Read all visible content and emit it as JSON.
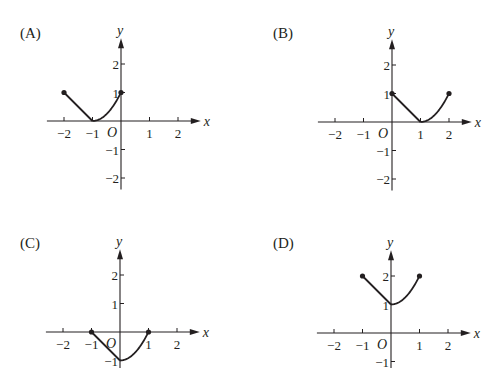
{
  "panels": [
    {
      "label": "(A)",
      "label_pos": [
        20,
        38
      ],
      "origin": [
        121,
        121
      ],
      "unit": 28.5,
      "x_range": [
        -2.6,
        2.8
      ],
      "y_range": [
        -2.4,
        2.9
      ],
      "x_ticks": [
        -2,
        -1,
        1,
        2
      ],
      "y_ticks": [
        2,
        1,
        -1,
        -2
      ],
      "axis_labels": {
        "x": "x",
        "y": "y",
        "origin": "O"
      },
      "segments": [
        {
          "type": "line",
          "points": [
            [
              -2,
              1
            ],
            [
              -1,
              0
            ]
          ]
        },
        {
          "type": "curve",
          "fn": "(x+1)^2",
          "domain": [
            -1,
            0
          ]
        }
      ],
      "dots": [
        [
          -2,
          1
        ],
        [
          0,
          1
        ]
      ]
    },
    {
      "label": "(B)",
      "label_pos": [
        273,
        38
      ],
      "origin": [
        392,
        122
      ],
      "unit": 28.5,
      "x_range": [
        -2.6,
        2.8
      ],
      "y_range": [
        -2.4,
        2.9
      ],
      "x_ticks": [
        -2,
        -1,
        1,
        2
      ],
      "y_ticks": [
        2,
        1,
        -1,
        -2
      ],
      "axis_labels": {
        "x": "x",
        "y": "y",
        "origin": "O"
      },
      "segments": [
        {
          "type": "line",
          "points": [
            [
              0,
              1
            ],
            [
              1,
              0
            ]
          ]
        },
        {
          "type": "curve",
          "fn": "(x-1)^2",
          "domain": [
            1,
            2
          ]
        }
      ],
      "dots": [
        [
          0,
          1
        ],
        [
          2,
          1
        ]
      ]
    },
    {
      "label": "(C)",
      "label_pos": [
        20,
        248
      ],
      "origin": [
        120,
        332
      ],
      "unit": 28.5,
      "x_range": [
        -2.6,
        2.8
      ],
      "y_range": [
        -1.3,
        2.9
      ],
      "x_ticks": [
        -2,
        -1,
        1,
        2
      ],
      "y_ticks": [
        2,
        1,
        -1
      ],
      "axis_labels": {
        "x": "x",
        "y": "y",
        "origin": "O"
      },
      "segments": [
        {
          "type": "line",
          "points": [
            [
              -1,
              0
            ],
            [
              0,
              -1
            ]
          ]
        },
        {
          "type": "curve",
          "fn": "x^2-1",
          "domain": [
            0,
            1
          ]
        }
      ],
      "dots": [
        [
          -1,
          0
        ],
        [
          1,
          0
        ]
      ]
    },
    {
      "label": "(D)",
      "label_pos": [
        273,
        248
      ],
      "origin": [
        391,
        333
      ],
      "unit": 28.5,
      "x_range": [
        -2.6,
        2.8
      ],
      "y_range": [
        -1.3,
        2.9
      ],
      "x_ticks": [
        -2,
        -1,
        1,
        2
      ],
      "y_ticks": [
        2,
        1,
        -1
      ],
      "axis_labels": {
        "x": "x",
        "y": "y",
        "origin": "O"
      },
      "segments": [
        {
          "type": "line",
          "points": [
            [
              -1,
              2
            ],
            [
              0,
              1
            ]
          ]
        },
        {
          "type": "curve",
          "fn": "x^2+1",
          "domain": [
            0,
            1
          ]
        }
      ],
      "dots": [
        [
          -1,
          2
        ],
        [
          1,
          2
        ]
      ]
    }
  ]
}
